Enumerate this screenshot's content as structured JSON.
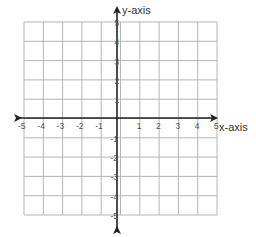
{
  "diagram": {
    "type": "coordinate-plane",
    "x_axis_label": "x-axis",
    "y_axis_label": "y-axis",
    "x_range": [
      -5,
      5
    ],
    "y_range": [
      -5,
      5
    ],
    "grid_step": 1,
    "x_ticks": [
      "-5",
      "-4",
      "-3",
      "-2",
      "-1",
      "1",
      "2",
      "3",
      "4",
      "5"
    ],
    "y_ticks": [
      "5",
      "4",
      "3",
      "2",
      "1",
      "-1",
      "-2",
      "-3",
      "-4",
      "-5"
    ],
    "colors": {
      "grid": "#b5b5b5",
      "axis": "#222222",
      "labels": "#555555"
    }
  }
}
